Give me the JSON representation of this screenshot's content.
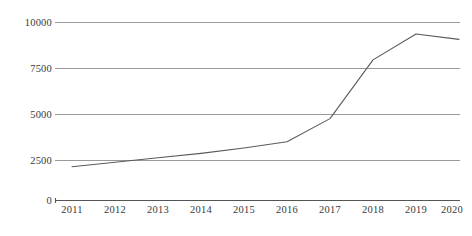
{
  "chart_data": {
    "type": "line",
    "title": "",
    "subtitle": "",
    "xlabel": "",
    "ylabel": "",
    "categories": [
      "2011",
      "2012",
      "2013",
      "2014",
      "2015",
      "2016",
      "2017",
      "2018",
      "2019",
      "2020"
    ],
    "values": [
      1900,
      2150,
      2400,
      2650,
      2950,
      3300,
      4600,
      7900,
      9350,
      9050
    ],
    "series": [
      {
        "name": "",
        "values": [
          1900,
          2150,
          2400,
          2650,
          2950,
          3300,
          4600,
          7900,
          9350,
          9050
        ]
      }
    ],
    "ylim": [
      0,
      10000
    ],
    "yticks": [
      0,
      2500,
      5000,
      7500,
      10000
    ],
    "ytick_labels": [
      "0",
      "2500",
      "5000",
      "7500",
      "10000"
    ],
    "xticks": [
      "2011",
      "2012",
      "2013",
      "2014",
      "2015",
      "2016",
      "2017",
      "2018",
      "2019",
      "2020"
    ],
    "grid": true,
    "grid_axis": "y",
    "legend": false,
    "legend_position": "none",
    "annotations": [],
    "colors": {
      "line": "#5a5a5a",
      "grid": "#9a9a9a",
      "axis": "#555555",
      "text": "#3a3a3a",
      "background": "#ffffff"
    }
  },
  "caption": {
    "text": ""
  }
}
